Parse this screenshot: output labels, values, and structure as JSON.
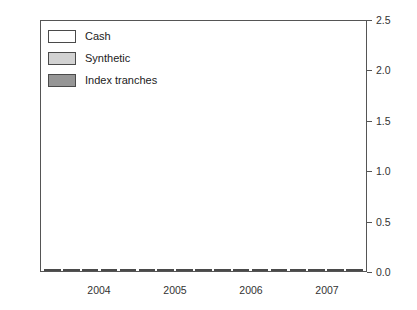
{
  "chart_data": {
    "type": "bar",
    "title": "",
    "subtitle": "",
    "xlabel": "",
    "ylabel": "",
    "ylim": [
      0.0,
      2.5
    ],
    "yticks": [
      "0.0",
      "0.5",
      "1.0",
      "1.5",
      "2.0",
      "2.5"
    ],
    "ytick_values": [
      0.0,
      0.5,
      1.0,
      1.5,
      2.0,
      2.5
    ],
    "grid": false,
    "legend_position": "top-left",
    "categories": [
      "2003Q4",
      "2004Q1",
      "2004Q2",
      "2004Q3",
      "2004Q4",
      "2005Q1",
      "2005Q2",
      "2005Q3",
      "2005Q4",
      "2006Q1",
      "2006Q2",
      "2006Q3",
      "2006Q4",
      "2007Q1",
      "2007Q2",
      "2007Q3",
      "2007Q4"
    ],
    "xtick_labels": [
      "2004",
      "2005",
      "2006",
      "2007"
    ],
    "xtick_positions": [
      2.5,
      6.5,
      10.5,
      14.5
    ],
    "series": [
      {
        "name": "Synthetic",
        "values": [
          0.1,
          0.06,
          0.2,
          0.1,
          0.32,
          0.38,
          0.36,
          0.18,
          0.52,
          0.29,
          0.64,
          0.92,
          0.92,
          0.9,
          1.0,
          0.85,
          0.18
        ]
      },
      {
        "name": "Cash",
        "values": [
          0.09,
          0.12,
          0.25,
          0.31,
          0.34,
          0.29,
          0.5,
          0.75,
          0.41,
          0.6,
          0.48,
          0.78,
          0.62,
          0.61,
          0.65,
          1.3,
          0.24
        ]
      },
      {
        "name": "Index tranches",
        "values": [
          0.04,
          0.05,
          0.17,
          0.22,
          0.24,
          0.47,
          0.55,
          0.62,
          1.13,
          1.6,
          2.05,
          2.05,
          2.46,
          1.86,
          2.17,
          1.92,
          0.02
        ]
      }
    ],
    "stacking": "Synthetic and Cash are stacked in the left bar of each quarter; Index tranches is a separate bar on the right"
  },
  "legend": {
    "items": [
      {
        "label": "Cash",
        "swatch": "cash",
        "color": "#ffffff"
      },
      {
        "label": "Synthetic",
        "swatch": "syn",
        "color": "#d2d2d2"
      },
      {
        "label": "Index tranches",
        "swatch": "idx",
        "color": "#969696"
      }
    ]
  },
  "colors": {
    "cash": "#ffffff",
    "synthetic": "#d2d2d2",
    "index_tranches": "#969696",
    "axis": "#555555",
    "text": "#333333"
  }
}
